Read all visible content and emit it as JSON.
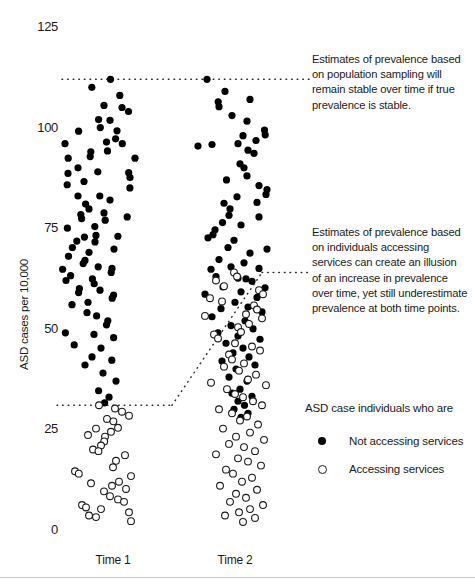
{
  "chart_data": {
    "type": "scatter",
    "title": "",
    "xlabel": "",
    "ylabel": "ASD cases per 10,000",
    "ylim": [
      0,
      125
    ],
    "yticks": [
      0,
      25,
      50,
      75,
      100,
      125
    ],
    "ytick_labels": [
      "0",
      "25",
      "50",
      "75",
      "100",
      "125"
    ],
    "categories": [
      "Time 1",
      "Time 2"
    ],
    "grid": false,
    "legend": {
      "position": "bottom-right",
      "title": "ASD case individuals who are",
      "entries": [
        {
          "marker": "filled-circle",
          "label": "Not accessing services"
        },
        {
          "marker": "open-circle",
          "label": "Accessing services"
        }
      ]
    },
    "reference_lines": [
      {
        "name": "true-prevalence-time1",
        "y": 112,
        "x_from": "Time 1",
        "x_to": "annotation-1",
        "style": "dotted"
      },
      {
        "name": "true-prevalence-time2",
        "y": 112,
        "x_from": "Time 2",
        "x_to": "annotation-1",
        "style": "dotted"
      },
      {
        "name": "service-accessing-time1",
        "y": 31,
        "x_from": "axis",
        "x_to": "Time 1",
        "style": "dotted"
      },
      {
        "name": "service-accessing-time2",
        "y": 64,
        "x_from": "Time 2",
        "x_to": "annotation-2",
        "style": "dotted"
      },
      {
        "name": "connector-diagonal",
        "from": [
          "Time 1",
          31
        ],
        "to": [
          "Time 2",
          64
        ],
        "style": "dotted"
      }
    ],
    "series": [
      {
        "name": "Not accessing services",
        "marker": "filled-circle",
        "group": "Time 1",
        "points": [
          [
            110.5,
            112.0
          ],
          [
            91.8,
            110.0
          ],
          [
            119.8,
            108.0
          ],
          [
            104.0,
            105.5
          ],
          [
            122.0,
            105.0
          ],
          [
            128.5,
            104.0
          ],
          [
            98.6,
            102.0
          ],
          [
            110.0,
            101.8
          ],
          [
            100.3,
            100.0
          ],
          [
            117.0,
            99.2
          ],
          [
            115.6,
            97.2
          ],
          [
            106.5,
            96.4
          ],
          [
            122.3,
            96.0
          ],
          [
            78.6,
            99.1
          ],
          [
            107.5,
            94.2
          ],
          [
            90.8,
            94.0
          ],
          [
            90.2,
            92.8
          ],
          [
            135.0,
            92.4
          ],
          [
            65.0,
            96.0
          ],
          [
            68.2,
            92.4
          ],
          [
            128.7,
            88.8
          ],
          [
            78.0,
            90.0
          ],
          [
            130.0,
            87.6
          ],
          [
            97.8,
            89.0
          ],
          [
            68.0,
            88.6
          ],
          [
            129.9,
            85.0
          ],
          [
            67.2,
            85.8
          ],
          [
            84.0,
            86.6
          ],
          [
            78.0,
            83.0
          ],
          [
            99.8,
            83.0
          ],
          [
            85.6,
            81.0
          ],
          [
            110.0,
            82.0
          ],
          [
            89.0,
            79.8
          ],
          [
            80.8,
            78.4
          ],
          [
            81.6,
            77.4
          ],
          [
            104.0,
            78.8
          ],
          [
            105.2,
            77.0
          ],
          [
            127.2,
            77.8
          ],
          [
            67.4,
            75.0
          ],
          [
            94.8,
            75.4
          ],
          [
            96.0,
            73.2
          ],
          [
            117.9,
            73.0
          ],
          [
            84.4,
            72.8
          ],
          [
            95.0,
            71.6
          ],
          [
            76.8,
            71.8
          ],
          [
            72.4,
            70.2
          ],
          [
            89.0,
            69.0
          ],
          [
            114.0,
            69.8
          ],
          [
            68.5,
            68.0
          ],
          [
            85.0,
            67.0
          ],
          [
            83.2,
            66.2
          ],
          [
            62.6,
            64.8
          ],
          [
            98.2,
            65.4
          ],
          [
            112.0,
            65.0
          ],
          [
            111.2,
            64.0
          ],
          [
            70.6,
            63.2
          ],
          [
            66.0,
            62.0
          ],
          [
            92.4,
            62.4
          ],
          [
            94.2,
            61.2
          ],
          [
            79.4,
            60.0
          ],
          [
            78.6,
            59.0
          ],
          [
            100.0,
            59.6
          ],
          [
            113.6,
            58.4
          ],
          [
            112.2,
            57.6
          ],
          [
            72.0,
            56.0
          ],
          [
            88.0,
            56.6
          ],
          [
            87.0,
            54.0
          ],
          [
            96.6,
            53.2
          ],
          [
            107.8,
            52.0
          ],
          [
            106.5,
            51.0
          ],
          [
            65.4,
            49.0
          ],
          [
            94.0,
            48.6
          ],
          [
            113.6,
            47.8
          ],
          [
            74.2,
            46.0
          ],
          [
            101.0,
            45.2
          ],
          [
            92.0,
            43.0
          ],
          [
            111.8,
            42.2
          ],
          [
            85.0,
            41.0
          ],
          [
            103.0,
            39.0
          ],
          [
            116.0,
            37.0
          ],
          [
            98.6,
            34.6
          ],
          [
            109.0,
            33.0
          ],
          [
            104.6,
            31.6
          ]
        ]
      },
      {
        "name": "Accessing services",
        "marker": "open-circle",
        "group": "Time 1",
        "points": [
          [
            99.0,
            31.0
          ],
          [
            115.0,
            30.2
          ],
          [
            122.0,
            29.4
          ],
          [
            129.0,
            28.4
          ],
          [
            107.0,
            27.6
          ],
          [
            113.4,
            27.0
          ],
          [
            118.0,
            25.4
          ],
          [
            96.0,
            25.2
          ],
          [
            111.0,
            24.4
          ],
          [
            88.0,
            23.6
          ],
          [
            105.0,
            23.2
          ],
          [
            104.2,
            22.0
          ],
          [
            101.0,
            21.0
          ],
          [
            93.0,
            20.0
          ],
          [
            98.5,
            19.6
          ],
          [
            125.0,
            18.6
          ],
          [
            116.0,
            17.2
          ],
          [
            113.0,
            15.6
          ],
          [
            75.0,
            14.6
          ],
          [
            78.8,
            14.0
          ],
          [
            131.0,
            13.4
          ],
          [
            119.0,
            12.0
          ],
          [
            91.0,
            11.6
          ],
          [
            112.0,
            11.0
          ],
          [
            126.0,
            10.2
          ],
          [
            104.0,
            9.6
          ],
          [
            110.0,
            8.4
          ],
          [
            118.0,
            7.6
          ],
          [
            124.0,
            7.0
          ],
          [
            82.0,
            6.2
          ],
          [
            86.0,
            5.6
          ],
          [
            101.0,
            5.2
          ],
          [
            129.0,
            4.4
          ],
          [
            89.0,
            3.6
          ],
          [
            96.0,
            3.2
          ],
          [
            131.0,
            2.2
          ]
        ]
      },
      {
        "name": "Not accessing services",
        "marker": "filled-circle",
        "group": "Time 2",
        "points": [
          [
            207.0,
            112.0
          ],
          [
            225.0,
            109.0
          ],
          [
            218.2,
            106.4
          ],
          [
            219.0,
            105.2
          ],
          [
            250.0,
            107.0
          ],
          [
            232.0,
            103.0
          ],
          [
            247.0,
            101.6
          ],
          [
            264.5,
            99.4
          ],
          [
            265.2,
            98.2
          ],
          [
            243.0,
            98.0
          ],
          [
            256.0,
            96.8
          ],
          [
            238.0,
            96.0
          ],
          [
            248.0,
            94.4
          ],
          [
            254.0,
            93.6
          ],
          [
            198.0,
            95.4
          ],
          [
            212.0,
            95.8
          ],
          [
            240.0,
            91.0
          ],
          [
            244.0,
            90.0
          ],
          [
            247.0,
            88.0
          ],
          [
            226.5,
            87.0
          ],
          [
            259.0,
            85.6
          ],
          [
            267.0,
            84.6
          ],
          [
            266.0,
            83.4
          ],
          [
            237.0,
            82.8
          ],
          [
            257.0,
            81.4
          ],
          [
            224.0,
            81.2
          ],
          [
            230.0,
            79.8
          ],
          [
            229.0,
            78.2
          ],
          [
            259.0,
            77.8
          ],
          [
            222.5,
            76.4
          ],
          [
            241.0,
            75.8
          ],
          [
            215.0,
            74.6
          ],
          [
            213.0,
            73.4
          ],
          [
            208.0,
            72.6
          ],
          [
            234.0,
            72.0
          ],
          [
            228.0,
            70.2
          ],
          [
            267.0,
            69.8
          ],
          [
            250.0,
            68.8
          ],
          [
            219.0,
            67.2
          ],
          [
            244.0,
            66.4
          ],
          [
            231.0,
            65.4
          ],
          [
            259.0,
            65.0
          ],
          [
            211.0,
            64.8
          ],
          [
            216.0,
            63.0
          ],
          [
            238.0,
            62.6
          ],
          [
            252.0,
            61.8
          ],
          [
            246.0,
            62.4
          ],
          [
            223.0,
            60.4
          ],
          [
            265.0,
            60.2
          ],
          [
            241.0,
            59.2
          ],
          [
            205.0,
            58.6
          ],
          [
            257.0,
            57.8
          ],
          [
            235.0,
            56.6
          ],
          [
            248.0,
            55.4
          ],
          [
            221.0,
            55.0
          ],
          [
            262.0,
            54.2
          ],
          [
            212.0,
            53.0
          ],
          [
            245.0,
            52.0
          ],
          [
            231.0,
            50.8
          ],
          [
            253.0,
            50.0
          ],
          [
            218.0,
            49.0
          ],
          [
            238.0,
            48.2
          ],
          [
            260.0,
            47.4
          ],
          [
            226.0,
            46.4
          ],
          [
            243.0,
            45.2
          ],
          [
            233.0,
            44.0
          ],
          [
            249.0,
            43.0
          ],
          [
            222.0,
            42.0
          ],
          [
            255.0,
            41.0
          ],
          [
            236.0,
            40.0
          ],
          [
            229.0,
            38.0
          ],
          [
            247.0,
            37.0
          ],
          [
            240.0,
            35.0
          ],
          [
            232.0,
            34.0
          ],
          [
            252.0,
            33.2
          ],
          [
            238.0,
            32.0
          ],
          [
            244.5,
            31.0
          ],
          [
            234.0,
            30.0
          ],
          [
            248.0,
            29.0
          ],
          [
            241.0,
            28.0
          ]
        ]
      },
      {
        "name": "Accessing services",
        "marker": "open-circle",
        "group": "Time 2",
        "points": [
          [
            234.0,
            64.0
          ],
          [
            237.0,
            63.0
          ],
          [
            216.0,
            62.0
          ],
          [
            224.0,
            60.6
          ],
          [
            259.0,
            59.6
          ],
          [
            263.0,
            58.6
          ],
          [
            210.0,
            57.6
          ],
          [
            222.0,
            56.8
          ],
          [
            254.0,
            55.8
          ],
          [
            257.0,
            54.8
          ],
          [
            246.0,
            53.6
          ],
          [
            205.0,
            53.2
          ],
          [
            262.0,
            52.6
          ],
          [
            249.0,
            51.2
          ],
          [
            238.0,
            50.4
          ],
          [
            241.0,
            49.2
          ],
          [
            214.0,
            48.6
          ],
          [
            218.0,
            47.6
          ],
          [
            235.0,
            46.4
          ],
          [
            252.0,
            45.6
          ],
          [
            260.0,
            44.6
          ],
          [
            229.0,
            43.6
          ],
          [
            232.0,
            42.4
          ],
          [
            244.0,
            41.4
          ],
          [
            224.0,
            40.6
          ],
          [
            239.0,
            39.6
          ],
          [
            256.0,
            38.6
          ],
          [
            248.0,
            37.4
          ],
          [
            211.0,
            36.6
          ],
          [
            266.0,
            36.0
          ],
          [
            227.0,
            35.0
          ],
          [
            235.0,
            33.8
          ],
          [
            243.0,
            33.0
          ],
          [
            253.0,
            32.0
          ],
          [
            262.0,
            31.0
          ],
          [
            219.0,
            30.0
          ],
          [
            232.0,
            29.0
          ],
          [
            247.0,
            28.2
          ],
          [
            240.0,
            27.2
          ],
          [
            258.0,
            26.2
          ],
          [
            223.0,
            25.2
          ],
          [
            250.0,
            24.2
          ],
          [
            236.0,
            23.2
          ],
          [
            264.0,
            22.4
          ],
          [
            229.0,
            21.4
          ],
          [
            244.0,
            20.6
          ],
          [
            255.0,
            19.6
          ],
          [
            216.0,
            18.8
          ],
          [
            238.0,
            17.8
          ],
          [
            248.0,
            17.0
          ],
          [
            261.0,
            16.0
          ],
          [
            226.0,
            15.0
          ],
          [
            233.0,
            14.0
          ],
          [
            252.0,
            13.0
          ],
          [
            242.0,
            12.0
          ],
          [
            220.0,
            11.0
          ],
          [
            257.0,
            10.0
          ],
          [
            236.0,
            9.0
          ],
          [
            246.0,
            8.0
          ],
          [
            230.0,
            7.0
          ],
          [
            263.0,
            6.2
          ],
          [
            250.0,
            5.2
          ],
          [
            239.0,
            4.4
          ],
          [
            225.0,
            3.6
          ],
          [
            255.0,
            3.0
          ],
          [
            243.0,
            2.0
          ]
        ]
      }
    ],
    "annotations": [
      {
        "name": "annotation-population-sampling",
        "lines": [
          "Estimates of prevalence based",
          "on population sampling will",
          "remain stable over time if true",
          "prevalence is stable."
        ]
      },
      {
        "name": "annotation-services-illusion",
        "lines": [
          "Estimates of prevalence based",
          "on individuals accessing",
          "services can create an illusion",
          "of an increase in prevalence",
          "over time, yet still underestimate",
          "prevalence at both time points."
        ]
      }
    ]
  },
  "colors": {
    "marker_fill": "#000000",
    "marker_stroke": "#1a1a1a",
    "text": "#1a1a1a",
    "dotted_line": "#2b2b2b",
    "rule": "#c9c9c9",
    "background": "#ffffff"
  }
}
